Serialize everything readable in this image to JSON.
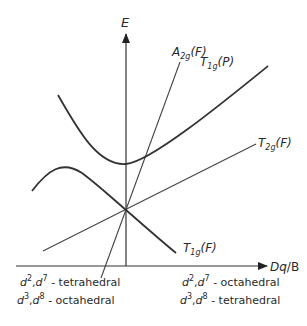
{
  "diagram": {
    "type": "orgel-diagram",
    "axes": {
      "y_label": "E",
      "x_label_main": "Dq",
      "x_label_sep": "/",
      "x_label_tail": "B"
    },
    "terms": [
      {
        "id": "a2g",
        "base": "A",
        "sub": "2g",
        "paren": "(F)"
      },
      {
        "id": "t1gp",
        "base": "T",
        "sub": "1g",
        "paren": "(P)"
      },
      {
        "id": "t2g",
        "base": "T",
        "sub": "2g",
        "paren": "(F)"
      },
      {
        "id": "t1gf",
        "base": "T",
        "sub": "1g",
        "paren": "(F)"
      }
    ],
    "left_captions": [
      {
        "a": "d",
        "a_sup": "2",
        "b": "d",
        "b_sup": "7",
        "geometry": "- tetrahedral"
      },
      {
        "a": "d",
        "a_sup": "3",
        "b": "d",
        "b_sup": "8",
        "geometry": "- octahedral"
      }
    ],
    "right_captions": [
      {
        "a": "d",
        "a_sup": "2",
        "b": "d",
        "b_sup": "7",
        "geometry": "- octahedral"
      },
      {
        "a": "d",
        "a_sup": "3",
        "b": "d",
        "b_sup": "8",
        "geometry": "- tetrahedral"
      }
    ],
    "colors": {
      "ink": "#333333",
      "background": "#ffffff"
    }
  }
}
